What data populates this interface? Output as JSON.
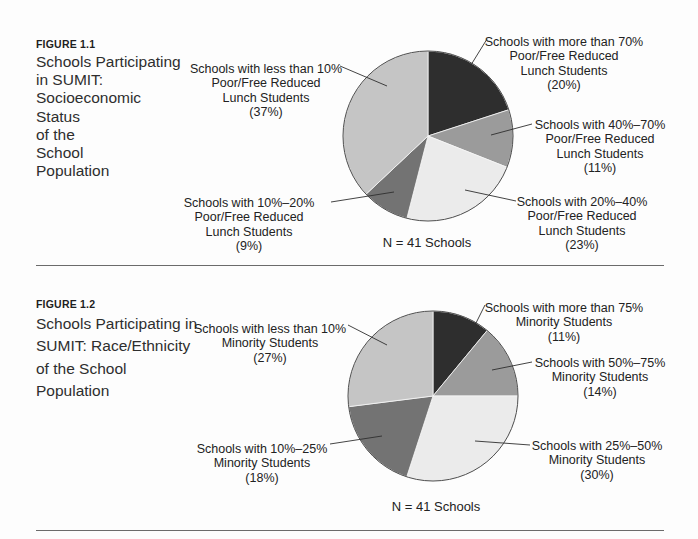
{
  "page": {
    "background_color": "#fdfdfd",
    "text_color": "#2b2b2b"
  },
  "figures": [
    {
      "label": "FIGURE 1.1",
      "title": "Schools Participating\nin SUMIT:\nSocioeconomic\nStatus\nof the\nSchool\nPopulation"
    },
    {
      "label": "FIGURE 1.2",
      "title": "Schools Participating in\nSUMIT: Race/Ethnicity\nof the School\nPopulation"
    }
  ],
  "chart_data": [
    {
      "type": "pie",
      "figure_label": "FIGURE 1.1",
      "title": "Schools Participating in SUMIT: Socioeconomic Status of the School Population",
      "note": "N = 41 Schools",
      "sample_size": 41,
      "start_angle": "12 o'clock",
      "direction": "clockwise",
      "legend_position": "callout-labels",
      "slices": [
        {
          "label": "Schools with more than 70%\nPoor/Free Reduced\nLunch Students\n(20%)",
          "value": 20,
          "color": "#2e2e2e"
        },
        {
          "label": "Schools with 40%–70%\nPoor/Free Reduced\nLunch Students\n(11%)",
          "value": 11,
          "color": "#9b9b9b"
        },
        {
          "label": "Schools with 20%–40%\nPoor/Free Reduced\nLunch Students\n(23%)",
          "value": 23,
          "color": "#ebebeb"
        },
        {
          "label": "Schools with 10%–20%\nPoor/Free Reduced\nLunch Students\n(9%)",
          "value": 9,
          "color": "#737373"
        },
        {
          "label": "Schools with less than 10%\nPoor/Free Reduced\nLunch Students\n(37%)",
          "value": 37,
          "color": "#c5c5c5"
        }
      ]
    },
    {
      "type": "pie",
      "figure_label": "FIGURE 1.2",
      "title": "Schools Participating in SUMIT: Race/Ethnicity of the School Population",
      "note": "N = 41 Schools",
      "sample_size": 41,
      "start_angle": "12 o'clock",
      "direction": "clockwise",
      "legend_position": "callout-labels",
      "slices": [
        {
          "label": "Schools with more than 75%\nMinority Students\n(11%)",
          "value": 11,
          "color": "#2e2e2e"
        },
        {
          "label": "Schools with 50%–75%\nMinority Students\n(14%)",
          "value": 14,
          "color": "#9b9b9b"
        },
        {
          "label": "Schools with 25%–50%\nMinority Students\n(30%)",
          "value": 30,
          "color": "#ebebeb"
        },
        {
          "label": "Schools with 10%–25%\nMinority Students\n(18%)",
          "value": 18,
          "color": "#737373"
        },
        {
          "label": "Schools with less than 10%\nMinority Students\n(27%)",
          "value": 27,
          "color": "#c5c5c5"
        }
      ]
    }
  ]
}
